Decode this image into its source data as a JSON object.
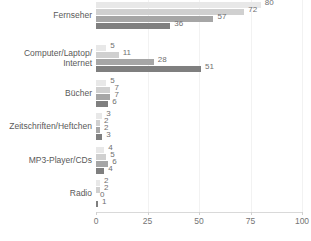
{
  "chart_data": {
    "type": "bar",
    "orientation": "horizontal",
    "title": "",
    "subtitle": "",
    "xlabel": "",
    "ylabel": "",
    "xlim": [
      0,
      100
    ],
    "xticks": [
      0,
      25,
      50,
      75,
      100
    ],
    "grid": true,
    "legend": "none",
    "categories": [
      "Fernseher",
      "Computer/Laptop/\nInternet",
      "Bücher",
      "Zeitschriften/Heftchen",
      "MP3-Player/CDs",
      "Radio"
    ],
    "series": [
      {
        "name": "series-1",
        "color": "#e8e8e8",
        "values": [
          80,
          5,
          5,
          3,
          4,
          2
        ]
      },
      {
        "name": "series-2",
        "color": "#d0d0d0",
        "values": [
          72,
          11,
          7,
          2,
          5,
          2
        ]
      },
      {
        "name": "series-3",
        "color": "#a6a6a6",
        "values": [
          57,
          28,
          7,
          2,
          6,
          0
        ]
      },
      {
        "name": "series-4",
        "color": "#7f7f7f",
        "values": [
          36,
          51,
          6,
          3,
          4,
          1
        ]
      }
    ],
    "value_labels": [
      [
        "80",
        "72",
        "57",
        "36"
      ],
      [
        "5",
        "11",
        "28",
        "51"
      ],
      [
        "5",
        "7",
        "7",
        "6"
      ],
      [
        "3",
        "2",
        "2",
        "3"
      ],
      [
        "4",
        "5",
        "6",
        "4"
      ],
      [
        "2",
        "2",
        "0",
        "1"
      ]
    ],
    "xtick_labels": [
      "0",
      "25",
      "50",
      "75",
      "100"
    ],
    "colors": {
      "bar_1": "#e8e8e8",
      "bar_2": "#d0d0d0",
      "bar_3": "#a6a6a6",
      "bar_4": "#7f7f7f",
      "gridline": "#f2f2f2",
      "axis": "#d9d9d9",
      "label_text": "#595959",
      "value_text": "#6f6f6f",
      "background": "#ffffff"
    }
  }
}
